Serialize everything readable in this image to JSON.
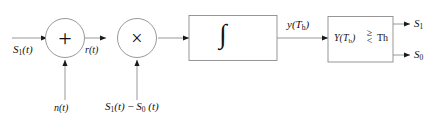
{
  "diagram": {
    "type": "signal-flow-block-diagram",
    "colors": {
      "line": "#8c8c8c",
      "box_stroke": "#8c8c8c",
      "arrowhead": "#1a1a1a",
      "text": "#121212",
      "background": "#ffffff"
    },
    "input": {
      "label_main": "S",
      "label_sub": "1",
      "label_arg": "(t)"
    },
    "adder": {
      "glyph": "+",
      "name": "summing-junction"
    },
    "noise": {
      "label_main": "n",
      "label_arg": "(t)"
    },
    "intermediate": {
      "label_main": "r",
      "label_arg": "(t)"
    },
    "multiplier": {
      "glyph": "×",
      "name": "product-modulator"
    },
    "reference": {
      "part1_main": "S",
      "part1_sub": "1",
      "part1_arg": "(t)",
      "minus": "−",
      "part2_main": "S",
      "part2_sub": "0",
      "part2_arg": "(t)"
    },
    "integrator": {
      "sign": "∫",
      "upper_limit_main": "T",
      "upper_limit_sub": "b",
      "lower_limit": "0"
    },
    "integrator_output": {
      "label_main": "y",
      "label_open": "(",
      "label_T": "T",
      "label_sub": "b",
      "label_close": ")"
    },
    "decision": {
      "var_main": "Y",
      "var_open": "(",
      "var_T": "T",
      "var_sub": "b",
      "var_close": ")",
      "cmp_top": "≥",
      "cmp_bottom": "<",
      "threshold": "Th"
    },
    "outputs": [
      {
        "main": "S",
        "sub": "1"
      },
      {
        "main": "S",
        "sub": "0"
      }
    ]
  }
}
